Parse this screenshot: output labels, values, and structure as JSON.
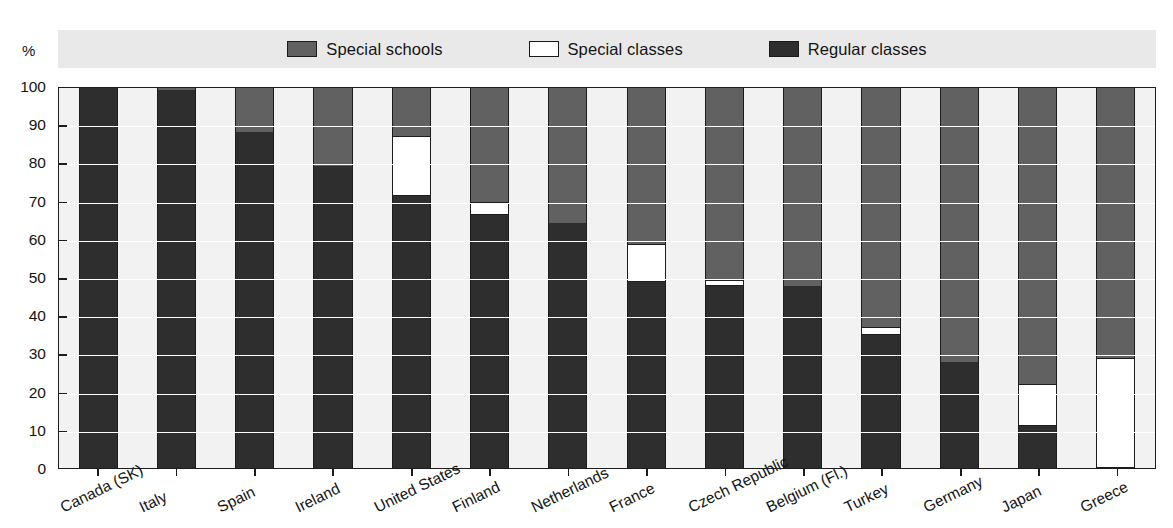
{
  "axis": {
    "percent_symbol": "%",
    "y_ticks": [
      "100",
      "90",
      "80",
      "70",
      "60",
      "50",
      "40",
      "30",
      "20",
      "10",
      "0"
    ],
    "ylim": [
      0,
      100
    ]
  },
  "legend": {
    "items": [
      {
        "label": "Special schools",
        "color": "#616161",
        "key": "special_schools"
      },
      {
        "label": "Special classes",
        "color": "#ffffff",
        "key": "special_classes"
      },
      {
        "label": "Regular classes",
        "color": "#2e2e2e",
        "key": "regular_classes"
      }
    ]
  },
  "chart_data": {
    "type": "bar",
    "stacked": true,
    "title": "",
    "xlabel": "",
    "ylabel": "%",
    "ylim": [
      0,
      100
    ],
    "grid": true,
    "legend_position": "top",
    "categories": [
      "Canada (SK)",
      "Italy",
      "Spain",
      "Ireland",
      "United States",
      "Finland",
      "Netherlands",
      "France",
      "Czech Republic",
      "Belgium (Fl.)",
      "Turkey",
      "Germany",
      "Japan",
      "Greece"
    ],
    "series": [
      {
        "name": "Regular classes",
        "color": "#2e2e2e",
        "values": [
          100,
          99.5,
          88.5,
          79.5,
          71.5,
          66.5,
          64.5,
          49,
          48,
          48,
          35,
          28,
          11,
          0
        ]
      },
      {
        "name": "Special classes",
        "color": "#ffffff",
        "values": [
          0,
          0,
          0,
          0,
          16,
          3.5,
          0,
          10,
          1.5,
          0,
          2,
          0,
          11,
          29
        ]
      },
      {
        "name": "Special schools",
        "color": "#616161",
        "values": [
          0,
          0.5,
          11.5,
          20.5,
          12.5,
          30,
          35.5,
          41,
          50.5,
          52,
          63,
          72,
          78,
          71
        ]
      }
    ]
  }
}
